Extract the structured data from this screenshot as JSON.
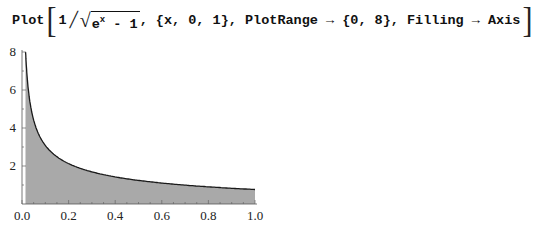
{
  "command": {
    "head": "Plot",
    "numerator": "1",
    "radicand_base": "e",
    "radicand_exp": "x",
    "radicand_rest": " - 1",
    "args": ", {x, 0, 1}, PlotRange → {0, 8}, Filling → Axis"
  },
  "chart_data": {
    "type": "area",
    "title": "",
    "function": "1/Sqrt[E^x - 1]",
    "xlabel": "",
    "ylabel": "",
    "xlim": [
      0,
      1
    ],
    "ylim": [
      0,
      8
    ],
    "grid": false,
    "filling": "Axis",
    "x_ticks": [
      "0.0",
      "0.2",
      "0.4",
      "0.6",
      "0.8",
      "1.0"
    ],
    "y_ticks": [
      "2",
      "4",
      "6",
      "8"
    ],
    "x": [
      0.015,
      0.02,
      0.03,
      0.05,
      0.075,
      0.1,
      0.15,
      0.2,
      0.3,
      0.4,
      0.5,
      0.6,
      0.7,
      0.8,
      0.9,
      1.0
    ],
    "values": [
      8.0,
      7.05,
      5.73,
      4.42,
      3.59,
      3.08,
      2.48,
      2.13,
      1.69,
      1.42,
      1.24,
      1.1,
      0.99,
      0.9,
      0.82,
      0.76
    ],
    "colors": {
      "fill": "#a9a9a9",
      "line": "#1a1a1a",
      "axis": "#555555"
    }
  }
}
